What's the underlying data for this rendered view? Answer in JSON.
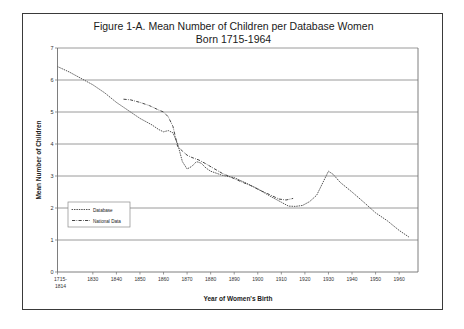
{
  "figure": {
    "title_line1": "Figure 1-A.  Mean Number of Children per Database Women",
    "title_line2": "Born 1715-1964"
  },
  "chart_data": {
    "type": "line",
    "title": "Figure 1-A.  Mean Number of Children per Database Women Born 1715-1964",
    "xlabel": "Year of Women's Birth",
    "ylabel": "Mean Number of Children",
    "xlim": [
      1815,
      1968
    ],
    "ylim": [
      0,
      7
    ],
    "ytick_values": [
      0,
      1,
      2,
      3,
      4,
      5,
      6,
      7
    ],
    "ytick_labels": [
      "0",
      "1",
      "2",
      "3",
      "4",
      "5",
      "6",
      "7"
    ],
    "xtick_values": [
      1815,
      1830,
      1840,
      1850,
      1860,
      1870,
      1880,
      1890,
      1900,
      1910,
      1920,
      1930,
      1940,
      1950,
      1960
    ],
    "xtick_labels": [
      "1715-\n1814",
      "1830",
      "1840",
      "1850",
      "1860",
      "1870",
      "1880",
      "1890",
      "1900",
      "1910",
      "1920",
      "1930",
      "1940",
      "1950",
      "1960"
    ],
    "grid": "horizontal",
    "legend_position": "lower-left-inside",
    "series": [
      {
        "name": "Database",
        "style": "dotted",
        "x": [
          1815,
          1820,
          1825,
          1830,
          1835,
          1840,
          1845,
          1850,
          1855,
          1858,
          1860,
          1862,
          1864,
          1866,
          1868,
          1870,
          1872,
          1874,
          1876,
          1878,
          1880,
          1885,
          1890,
          1895,
          1900,
          1905,
          1910,
          1913,
          1916,
          1919,
          1922,
          1925,
          1928,
          1930,
          1932,
          1935,
          1940,
          1945,
          1950,
          1955,
          1960,
          1964
        ],
        "y": [
          6.42,
          6.25,
          6.05,
          5.85,
          5.6,
          5.3,
          5.05,
          4.8,
          4.6,
          4.45,
          4.38,
          4.42,
          4.35,
          4.0,
          3.45,
          3.22,
          3.3,
          3.45,
          3.4,
          3.25,
          3.15,
          3.02,
          2.95,
          2.78,
          2.6,
          2.38,
          2.18,
          2.06,
          2.05,
          2.08,
          2.2,
          2.4,
          2.85,
          3.15,
          3.05,
          2.8,
          2.5,
          2.18,
          1.85,
          1.6,
          1.3,
          1.1
        ]
      },
      {
        "name": "National Data",
        "style": "dash-dot",
        "x": [
          1843,
          1846,
          1850,
          1854,
          1858,
          1860,
          1862,
          1864,
          1866,
          1868,
          1870,
          1872,
          1875,
          1878,
          1881,
          1885,
          1889,
          1893,
          1897,
          1901,
          1905,
          1909,
          1912,
          1915
        ],
        "y": [
          5.4,
          5.38,
          5.3,
          5.2,
          5.06,
          5.0,
          4.85,
          4.55,
          3.92,
          3.78,
          3.65,
          3.58,
          3.5,
          3.38,
          3.25,
          3.08,
          2.95,
          2.82,
          2.7,
          2.55,
          2.42,
          2.28,
          2.25,
          2.3
        ]
      }
    ]
  },
  "legend": {
    "items": [
      {
        "label": "Database"
      },
      {
        "label": "National Data"
      }
    ]
  }
}
